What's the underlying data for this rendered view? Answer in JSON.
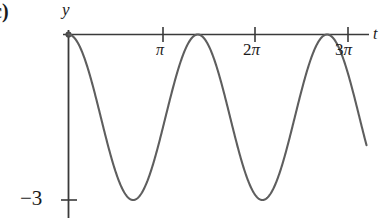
{
  "figure": {
    "part_label": "c)",
    "axes": {
      "x_axis_label": "t",
      "y_axis_label": "y",
      "x_ticks": [
        {
          "label": "π",
          "value": 3.14159
        },
        {
          "label": "2π",
          "value": 6.28319
        },
        {
          "label": "3π",
          "value": 9.42478
        }
      ],
      "y_ticks": [
        {
          "label": "−3",
          "value": -3
        }
      ],
      "x_axis_color": "#3a3a3a",
      "y_axis_color": "#3a3a3a"
    },
    "curve": {
      "color": "#5e5e5e",
      "stroke_width": 2.1
    }
  },
  "chart_data": {
    "type": "line",
    "title": "",
    "xlabel": "t",
    "ylabel": "y",
    "xlim": [
      0,
      10.1
    ],
    "ylim": [
      -3.6,
      0.35
    ],
    "grid": false,
    "legend": null,
    "xticks": [
      3.14159,
      6.28319,
      9.42478
    ],
    "xticklabels": [
      "π",
      "2π",
      "3π"
    ],
    "yticks": [
      -3
    ],
    "yticklabels": [
      "−3"
    ],
    "annotations": [
      "c)"
    ],
    "series": [
      {
        "name": "y = -1.5 + 1.5 cos(2πt/T)",
        "description": "Cosine oscillating between 0 and -3, starting at a maximum of 0 at t = 0",
        "amplitude": 1.5,
        "midline": -1.5,
        "maximum": 0,
        "minimum": -3,
        "period": 4.36,
        "maxima_t": [
          0,
          4.36,
          8.72
        ],
        "minima_t": [
          2.18,
          6.54
        ],
        "x": [
          0,
          0.218,
          0.436,
          0.654,
          0.872,
          1.09,
          1.308,
          1.526,
          1.744,
          1.962,
          2.18,
          2.398,
          2.616,
          2.834,
          3.052,
          3.27,
          3.488,
          3.706,
          3.924,
          4.142,
          4.36,
          4.578,
          4.796,
          5.014,
          5.232,
          5.45,
          5.668,
          5.886,
          6.104,
          6.322,
          6.54,
          6.758,
          6.976,
          7.194,
          7.412,
          7.63,
          7.848,
          8.066,
          8.284,
          8.502,
          8.72,
          8.938,
          9.156,
          9.374,
          9.592,
          9.81,
          10.028
        ],
        "y": [
          0,
          -0.07,
          -0.29,
          -0.62,
          -1.04,
          -1.5,
          -1.96,
          -2.38,
          -2.71,
          -2.93,
          -3,
          -2.93,
          -2.71,
          -2.38,
          -1.96,
          -1.5,
          -1.04,
          -0.62,
          -0.29,
          -0.07,
          0,
          -0.07,
          -0.29,
          -0.62,
          -1.04,
          -1.5,
          -1.96,
          -2.38,
          -2.71,
          -2.93,
          -3,
          -2.93,
          -2.71,
          -2.38,
          -1.96,
          -1.5,
          -1.04,
          -0.62,
          -0.29,
          -0.07,
          0,
          -0.07,
          -0.29,
          -0.62,
          -1.04,
          -1.5,
          -1.96
        ]
      }
    ]
  }
}
